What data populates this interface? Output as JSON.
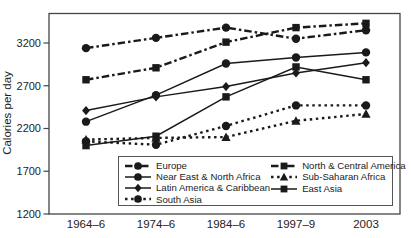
{
  "figure": {
    "background": "#ffffff",
    "ink": "#1a1a1a"
  },
  "chart_data": {
    "type": "line",
    "title": "",
    "xlabel": "",
    "ylabel": "Calories per day",
    "categories": [
      "1964–6",
      "1974–6",
      "1984–6",
      "1997–9",
      "2003"
    ],
    "yticks": [
      3200,
      2700,
      2200,
      1700,
      1200
    ],
    "ylim": [
      1200,
      3550
    ],
    "grid": false,
    "legend_position": "inside-bottom",
    "series": [
      {
        "name": "Europe",
        "marker": "circle",
        "line": "dashdot",
        "values": [
          3140,
          3260,
          3380,
          3250,
          3350
        ]
      },
      {
        "name": "Near East & North Africa",
        "marker": "circle",
        "line": "solid",
        "values": [
          2280,
          2590,
          2960,
          3030,
          3090
        ]
      },
      {
        "name": "Latin America & Caribbean",
        "marker": "diamond",
        "line": "solid",
        "values": [
          2410,
          2570,
          2690,
          2850,
          2970
        ]
      },
      {
        "name": "South Asia",
        "marker": "circle",
        "line": "dotted",
        "values": [
          2050,
          2010,
          2230,
          2470,
          2470
        ]
      },
      {
        "name": "North & Central America",
        "marker": "square",
        "line": "dashdot",
        "values": [
          2770,
          2910,
          3210,
          3380,
          3430
        ]
      },
      {
        "name": "Sub-Saharan Africa",
        "marker": "triangle",
        "line": "dotted",
        "values": [
          2070,
          2090,
          2100,
          2290,
          2370
        ]
      },
      {
        "name": "East Asia",
        "marker": "square",
        "line": "solid",
        "values": [
          2000,
          2110,
          2570,
          2920,
          2770
        ]
      }
    ]
  }
}
